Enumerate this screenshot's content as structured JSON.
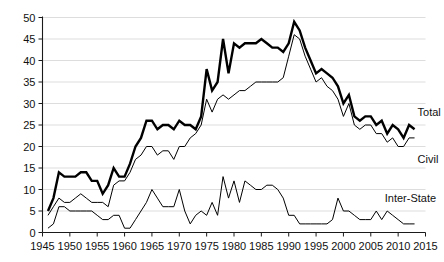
{
  "chart_data": {
    "type": "line",
    "title": "",
    "subtitle": "",
    "xlabel": "",
    "ylabel": "",
    "xlim": [
      1945,
      2015
    ],
    "ylim": [
      0,
      50
    ],
    "grid": true,
    "legend_position": "right-inline",
    "x_ticks": [
      1945,
      1950,
      1955,
      1960,
      1965,
      1970,
      1975,
      1980,
      1985,
      1990,
      1995,
      2000,
      2005,
      2010,
      2015
    ],
    "y_ticks": [
      0,
      5,
      10,
      15,
      20,
      25,
      30,
      35,
      40,
      45,
      50
    ],
    "x": [
      1946,
      1947,
      1948,
      1949,
      1950,
      1951,
      1952,
      1953,
      1954,
      1955,
      1956,
      1957,
      1958,
      1959,
      1960,
      1961,
      1962,
      1963,
      1964,
      1965,
      1966,
      1967,
      1968,
      1969,
      1970,
      1971,
      1972,
      1973,
      1974,
      1975,
      1976,
      1977,
      1978,
      1979,
      1980,
      1981,
      1982,
      1983,
      1984,
      1985,
      1986,
      1987,
      1988,
      1989,
      1990,
      1991,
      1992,
      1993,
      1994,
      1995,
      1996,
      1997,
      1998,
      1999,
      2000,
      2001,
      2002,
      2003,
      2004,
      2005,
      2006,
      2007,
      2008,
      2009,
      2010,
      2011,
      2012,
      2013
    ],
    "series": [
      {
        "name": "Total",
        "style": "thick",
        "values": [
          5,
          8,
          14,
          13,
          13,
          13,
          14,
          14,
          12,
          12,
          9,
          11,
          15,
          13,
          13,
          16,
          20,
          22,
          26,
          26,
          24,
          25,
          25,
          24,
          26,
          25,
          25,
          24,
          27,
          38,
          33,
          35,
          45,
          37,
          44,
          43,
          44,
          44,
          44,
          45,
          44,
          43,
          43,
          42,
          44,
          49,
          47,
          43,
          40,
          37,
          38,
          37,
          36,
          34,
          30,
          32,
          27,
          26,
          27,
          27,
          25,
          26,
          23,
          25,
          24,
          22,
          25,
          24
        ]
      },
      {
        "name": "Civil",
        "style": "thin",
        "values": [
          4,
          6,
          8,
          7,
          7,
          8,
          9,
          8,
          7,
          7,
          7,
          6,
          11,
          12,
          12,
          14,
          17,
          18,
          20,
          20,
          18,
          19,
          19,
          17,
          20,
          20,
          22,
          23,
          25,
          31,
          28,
          31,
          32,
          31,
          32,
          33,
          33,
          34,
          35,
          35,
          35,
          35,
          35,
          36,
          41,
          46,
          45,
          41,
          38,
          35,
          36,
          34,
          33,
          31,
          27,
          30,
          25,
          24,
          25,
          25,
          23,
          23,
          21,
          22,
          20,
          20,
          22,
          22
        ]
      },
      {
        "name": "Inter-State",
        "style": "thin",
        "values": [
          1,
          2,
          6,
          6,
          5,
          5,
          5,
          5,
          5,
          4,
          3,
          3,
          4,
          4,
          1,
          1,
          3,
          5,
          7,
          10,
          8,
          6,
          6,
          6,
          10,
          5,
          2,
          4,
          5,
          4,
          7,
          4,
          13,
          8,
          12,
          7,
          12,
          11,
          10,
          10,
          11,
          11,
          10,
          8,
          4,
          4,
          2,
          2,
          2,
          2,
          2,
          2,
          3,
          8,
          5,
          5,
          4,
          3,
          3,
          3,
          5,
          3,
          5,
          4,
          3,
          2,
          2,
          2
        ]
      }
    ],
    "annotations": [
      {
        "text": "Total",
        "x": 2013,
        "y": 28
      },
      {
        "text": "Civil",
        "x": 2013,
        "y": 17
      },
      {
        "text": "Inter-State",
        "x": 2007,
        "y": 8
      }
    ]
  }
}
